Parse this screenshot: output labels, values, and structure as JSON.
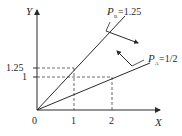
{
  "diagram": {
    "axes": {
      "y_label": "Y",
      "x_label": "X",
      "origin_label": "0"
    },
    "x_ticks": [
      {
        "label": "1",
        "value": 1
      },
      {
        "label": "2",
        "value": 2
      }
    ],
    "y_ticks": [
      {
        "label": "1",
        "value": 1
      },
      {
        "label": "1.25",
        "value": 1.25
      }
    ],
    "lines": [
      {
        "id": "B",
        "label_main": "P",
        "label_sub": "B",
        "label_value": "=1.25",
        "slope": 1.25,
        "arrow_direction": "clockwise (down-right)"
      },
      {
        "id": "A",
        "label_main": "P",
        "label_sub": "A",
        "label_value": "=1/2",
        "slope": 0.5,
        "arrow_direction": "counter-clockwise (up-left)"
      }
    ],
    "guides": [
      {
        "from": "y=1.25",
        "to": "point (1, 1.25)",
        "style": "dashed"
      },
      {
        "from": "y=1",
        "to": "point (2, 1)",
        "style": "dashed"
      },
      {
        "from": "x=1",
        "to": "point (1, 1.25)",
        "style": "dashed"
      },
      {
        "from": "x=2",
        "to": "point (2, 1)",
        "style": "dashed"
      }
    ],
    "colors": {
      "line": "#2a2a2a",
      "background": "#ffffff"
    }
  }
}
